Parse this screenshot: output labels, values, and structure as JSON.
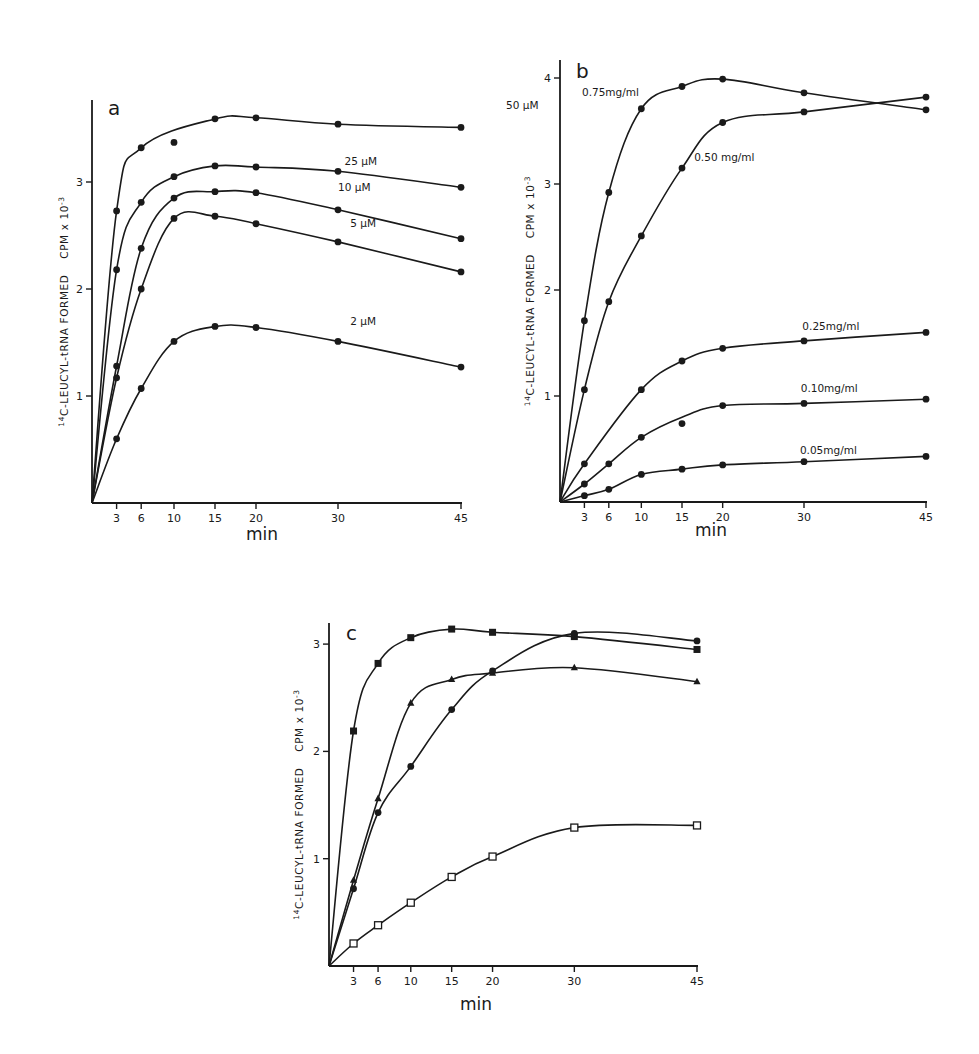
{
  "figure": {
    "panels": [
      "a",
      "b",
      "c"
    ]
  },
  "chart_data": [
    {
      "type": "line",
      "panel": "a",
      "title": "a",
      "xlabel": "min",
      "ylabel": "14C-LEUCYL-tRNA FORMED   CPM x 10^-3",
      "ylabel_parts": {
        "sup": "14",
        "main": "C-LEUCYL-tRNA  FORMED",
        "unit": "CPM x 10",
        "exp": "-3"
      },
      "x_ticks": [
        3,
        6,
        10,
        15,
        20,
        30,
        45
      ],
      "y_ticks": [
        1,
        2,
        3
      ],
      "xlim": [
        0,
        45
      ],
      "ylim": [
        0,
        3.75
      ],
      "grid": false,
      "legend": "inline labels",
      "x": [
        0,
        3,
        6,
        10,
        15,
        20,
        30,
        45
      ],
      "series": [
        {
          "name": "50µM",
          "label": "50 µM",
          "marker": "circle",
          "values": [
            0,
            2.73,
            3.32,
            3.37,
            3.59,
            3.6,
            3.54,
            3.51
          ],
          "label_pos": [
            50.5,
            3.68
          ]
        },
        {
          "name": "25µM",
          "label": "25 µM",
          "marker": "circle",
          "values": [
            0,
            2.18,
            2.81,
            3.05,
            3.15,
            3.14,
            3.1,
            2.95
          ],
          "label_pos": [
            30.8,
            3.16
          ]
        },
        {
          "name": "10µM",
          "label": "10 µM",
          "marker": "circle",
          "values": [
            0,
            1.28,
            2.38,
            2.85,
            2.91,
            2.9,
            2.74,
            2.47
          ],
          "label_pos": [
            30.0,
            2.92
          ]
        },
        {
          "name": "5µM",
          "label": "5 µM",
          "marker": "circle",
          "values": [
            0,
            1.17,
            2.0,
            2.66,
            2.68,
            2.61,
            2.44,
            2.16
          ],
          "label_pos": [
            31.5,
            2.58
          ]
        },
        {
          "name": "2µM",
          "label": "2 µM",
          "marker": "circle",
          "values": [
            0,
            0.6,
            1.07,
            1.51,
            1.65,
            1.64,
            1.51,
            1.27
          ],
          "label_pos": [
            31.5,
            1.66
          ]
        }
      ],
      "annotations": [
        "Point at 10 min on 50µM curve lies off the fitted line (3.37)"
      ]
    },
    {
      "type": "line",
      "panel": "b",
      "title": "b",
      "xlabel": "min",
      "ylabel": "14C-LEUCYL-tRNA FORMED   CPM x 10^-3",
      "ylabel_parts": {
        "sup": "14",
        "main": "C-LEUCYL-tRNA  FORMED",
        "unit": "CPM x 10",
        "exp": "-3"
      },
      "x_ticks": [
        3,
        6,
        10,
        15,
        20,
        30,
        45
      ],
      "y_ticks": [
        1,
        2,
        3,
        4
      ],
      "xlim": [
        0,
        45
      ],
      "ylim": [
        0,
        4.2
      ],
      "grid": false,
      "legend": "inline labels",
      "x": [
        0,
        3,
        6,
        10,
        15,
        20,
        30,
        45
      ],
      "series": [
        {
          "name": "0.75mg/ml",
          "label": "0.75mg/ml",
          "marker": "circle",
          "values": [
            0,
            1.71,
            2.92,
            3.71,
            3.92,
            3.99,
            3.86,
            3.7
          ],
          "label_pos": [
            2.7,
            3.83
          ]
        },
        {
          "name": "0.50 mg/ml",
          "label": "0.50 mg/ml",
          "marker": "circle",
          "values": [
            0,
            1.06,
            1.89,
            2.51,
            3.15,
            3.58,
            3.68,
            3.82
          ],
          "label_pos": [
            16.5,
            3.22
          ]
        },
        {
          "name": "0.25mg/ml",
          "label": "0.25mg/ml",
          "marker": "circle",
          "values": [
            0,
            0.36,
            null,
            1.06,
            1.33,
            1.45,
            1.52,
            1.6
          ],
          "label_pos": [
            29.8,
            1.62
          ]
        },
        {
          "name": "0.10mg/ml",
          "label": "0.10mg/ml",
          "marker": "circle",
          "values": [
            0,
            0.17,
            0.36,
            0.61,
            0.74,
            0.91,
            0.93,
            0.97
          ],
          "label_pos": [
            29.6,
            1.04
          ]
        },
        {
          "name": "0.05mg/ml",
          "label": "0.05mg/ml",
          "marker": "circle",
          "values": [
            0,
            0.06,
            0.12,
            0.26,
            0.31,
            0.35,
            0.38,
            0.43
          ],
          "label_pos": [
            29.5,
            0.45
          ]
        }
      ],
      "annotations": [
        "0.10mg/ml point at 15 min lies below fitted curve (0.74)"
      ]
    },
    {
      "type": "line",
      "panel": "c",
      "title": "c",
      "xlabel": "min",
      "ylabel": "14C-LEUCYL-tRNA FORMED   CPM x 10^-3",
      "ylabel_parts": {
        "sup": "14",
        "main": "C-LEUCYL-tRNA  FORMED",
        "unit": "CPM x 10",
        "exp": "-3"
      },
      "x_ticks": [
        3,
        6,
        10,
        15,
        20,
        30,
        45
      ],
      "y_ticks": [
        1,
        2,
        3
      ],
      "xlim": [
        0,
        45
      ],
      "ylim": [
        0,
        3.2
      ],
      "grid": false,
      "legend": "none (marker shapes only)",
      "x": [
        0,
        3,
        6,
        10,
        15,
        20,
        30,
        45
      ],
      "series": [
        {
          "name": "filled square",
          "marker": "square",
          "values": [
            0,
            2.19,
            2.82,
            3.06,
            3.14,
            3.11,
            3.07,
            2.95
          ]
        },
        {
          "name": "filled triangle",
          "marker": "triangle",
          "values": [
            0,
            0.8,
            1.56,
            2.45,
            2.67,
            2.73,
            2.78,
            2.65
          ]
        },
        {
          "name": "filled circle",
          "marker": "circle",
          "values": [
            0,
            0.72,
            1.43,
            1.86,
            2.39,
            2.75,
            3.1,
            3.03
          ]
        },
        {
          "name": "open square",
          "marker": "open-square",
          "values": [
            0,
            0.21,
            0.38,
            0.59,
            0.83,
            1.02,
            1.29,
            1.31
          ]
        }
      ]
    }
  ],
  "layout": {
    "panels": [
      {
        "id": "a",
        "x0": 92,
        "y0": 503,
        "x45": 461,
        "unit": 107,
        "axis_top": 100,
        "letter_pos": [
          108,
          115
        ],
        "xlabel_pos": [
          262,
          540
        ],
        "ylabel_x": 68
      },
      {
        "id": "b",
        "x0": 560,
        "y0": 502,
        "x45": 926,
        "unit": 106,
        "axis_top": 60,
        "letter_pos": [
          576,
          78
        ],
        "xlabel_pos": [
          711,
          536
        ],
        "ylabel_x": 534
      },
      {
        "id": "c",
        "x0": 329,
        "y0": 966,
        "x45": 697,
        "unit": 107.3,
        "axis_top": 623,
        "letter_pos": [
          346,
          640
        ],
        "xlabel_pos": [
          476,
          1010
        ],
        "ylabel_x": 303
      }
    ]
  }
}
